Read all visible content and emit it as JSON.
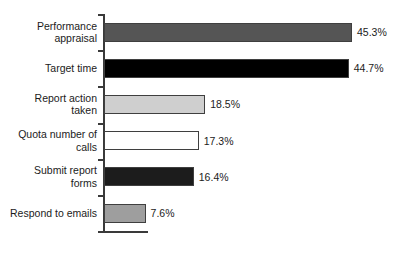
{
  "chart_data": {
    "type": "bar",
    "orientation": "horizontal",
    "title": "",
    "subtitle": "",
    "xlabel": "",
    "ylabel": "",
    "grid": false,
    "legend": false,
    "legend_position": "none",
    "xlim": [
      0,
      50
    ],
    "value_suffix": "%",
    "categories": [
      "Performance\nappraisal",
      "Target time",
      "Report action\ntaken",
      "Quota number of\ncalls",
      "Submit report\nforms",
      "Respond to emails"
    ],
    "values": [
      45.3,
      44.7,
      18.5,
      17.3,
      16.4,
      7.6
    ],
    "value_labels": [
      "45.3%",
      "44.7%",
      "18.5%",
      "17.3%",
      "16.4%",
      "7.6%"
    ],
    "bar_colors": [
      "#555555",
      "#000000",
      "#cfcfcf",
      "#ffffff",
      "#1c1c1c",
      "#9e9e9e"
    ],
    "bar_outline_color": "#3f3f3f"
  },
  "axis": {
    "spine_color": "#3a3a3a",
    "tick_count": 7
  },
  "bars": [
    {
      "label": "Performance\nappraisal",
      "value": 45.3,
      "value_label": "45.3%",
      "color": "#555555"
    },
    {
      "label": "Target time",
      "value": 44.7,
      "value_label": "44.7%",
      "color": "#000000"
    },
    {
      "label": "Report action\ntaken",
      "value": 18.5,
      "value_label": "18.5%",
      "color": "#cfcfcf"
    },
    {
      "label": "Quota number of\ncalls",
      "value": 17.3,
      "value_label": "17.3%",
      "color": "#ffffff"
    },
    {
      "label": "Submit report\nforms",
      "value": 16.4,
      "value_label": "16.4%",
      "color": "#1c1c1c"
    },
    {
      "label": "Respond to emails",
      "value": 7.6,
      "value_label": "7.6%",
      "color": "#9e9e9e"
    }
  ]
}
